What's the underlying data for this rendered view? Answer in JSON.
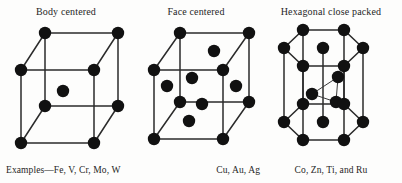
{
  "figure": {
    "background_color": "#fdfdfc",
    "atom_color": "#111111",
    "edge_color": "#2b2b2b",
    "panels": [
      {
        "id": "bcc",
        "title": "Body centered",
        "caption": "Examples—Fe, V, Cr, Mo, W",
        "structure": "body-centered-cubic",
        "atom_count": 9,
        "elements": [
          "Fe",
          "V",
          "Cr",
          "Mo",
          "W"
        ]
      },
      {
        "id": "fcc",
        "title": "Face centered",
        "caption": "Cu, Au, Ag",
        "structure": "face-centered-cubic",
        "atom_count": 14,
        "elements": [
          "Cu",
          "Au",
          "Ag"
        ]
      },
      {
        "id": "hcp",
        "title": "Hexagonal close packed",
        "caption": "Co, Zn, Ti, and Ru",
        "structure": "hexagonal-close-packed",
        "atom_count": 17,
        "elements": [
          "Co",
          "Zn",
          "Ti",
          "Ru"
        ]
      }
    ]
  }
}
